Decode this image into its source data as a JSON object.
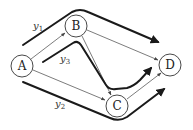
{
  "diagram": {
    "type": "network-flow-paths",
    "nodes": [
      {
        "id": "A",
        "label": "A",
        "x": 22,
        "y": 66
      },
      {
        "id": "B",
        "label": "B",
        "x": 76,
        "y": 26
      },
      {
        "id": "C",
        "label": "C",
        "x": 117,
        "y": 106
      },
      {
        "id": "D",
        "label": "D",
        "x": 170,
        "y": 65
      }
    ],
    "edges": [
      {
        "from": "A",
        "to": "B"
      },
      {
        "from": "A",
        "to": "C"
      },
      {
        "from": "B",
        "to": "C"
      },
      {
        "from": "B",
        "to": "D"
      },
      {
        "from": "C",
        "to": "D"
      }
    ],
    "paths": [
      {
        "id": "y1",
        "label": "y",
        "subscript": "1",
        "route": [
          "A",
          "B",
          "D"
        ]
      },
      {
        "id": "y2",
        "label": "y",
        "subscript": "2",
        "route": [
          "A",
          "C",
          "D"
        ]
      },
      {
        "id": "y3",
        "label": "y",
        "subscript": "3",
        "route": [
          "A",
          "B",
          "C",
          "D"
        ]
      }
    ],
    "colors": {
      "node_stroke": "#333333",
      "edge": "#444444",
      "path": "#1a1a1a",
      "background": "#ffffff"
    }
  }
}
